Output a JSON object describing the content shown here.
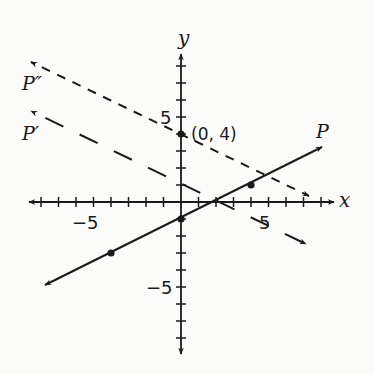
{
  "diagram": {
    "type": "coordinate-plane",
    "axes": {
      "x_label": "x",
      "y_label": "y",
      "x_tick_labels": [
        "−5",
        "5"
      ],
      "y_tick_labels": [
        "5",
        "−5"
      ],
      "x_range": [
        -8,
        8
      ],
      "y_range": [
        -8,
        8
      ]
    },
    "lines": [
      {
        "name": "P",
        "label": "P",
        "style": "solid",
        "equation": "y = x/2 - 1",
        "points": [
          [
            -4,
            -3
          ],
          [
            0,
            -1
          ],
          [
            4,
            1
          ]
        ]
      },
      {
        "name": "P_prime",
        "label": "P′",
        "style": "long-dash",
        "equation": "y = 1 - x/2"
      },
      {
        "name": "P_double_prime",
        "label": "P″",
        "style": "short-dash",
        "equation": "y = 4 - x/2",
        "points": [
          [
            0,
            4
          ]
        ]
      }
    ],
    "annotations": {
      "point_label": "(0, 4)"
    },
    "colors": {
      "ink": "#1a1a1a",
      "background": "#fbfbf9"
    }
  }
}
